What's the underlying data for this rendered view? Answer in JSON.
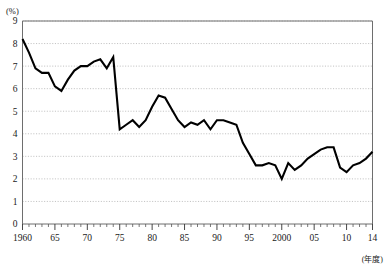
{
  "chart_data": {
    "type": "line",
    "title": "",
    "subtitle": "",
    "xlabel": "(年度)",
    "ylabel": "(%)",
    "ylim": [
      0,
      9
    ],
    "xlim": [
      1960,
      2014
    ],
    "grid": true,
    "legend": "none",
    "y_unit_label": "(%)",
    "x_unit_label": "(年度)",
    "y_ticks": [
      0,
      1,
      2,
      3,
      4,
      5,
      6,
      7,
      8,
      9
    ],
    "y_tick_labels": [
      "0",
      "1",
      "2",
      "3",
      "4",
      "5",
      "6",
      "7",
      "8",
      "9"
    ],
    "x_ticks": [
      1960,
      1965,
      1970,
      1975,
      1980,
      1985,
      1990,
      1995,
      2000,
      2005,
      2010,
      2014
    ],
    "x_tick_labels": [
      "1960",
      "65",
      "70",
      "75",
      "80",
      "85",
      "90",
      "95",
      "2000",
      "05",
      "10",
      "14"
    ],
    "x_minor_tick_step": 1,
    "series": [
      {
        "name": "",
        "color": "#000000",
        "x": [
          1960,
          1961,
          1962,
          1963,
          1964,
          1965,
          1966,
          1967,
          1968,
          1969,
          1970,
          1971,
          1972,
          1973,
          1974,
          1975,
          1976,
          1977,
          1978,
          1979,
          1980,
          1981,
          1982,
          1983,
          1984,
          1985,
          1986,
          1987,
          1988,
          1989,
          1990,
          1991,
          1992,
          1993,
          1994,
          1995,
          1996,
          1997,
          1998,
          1999,
          2000,
          2001,
          2002,
          2003,
          2004,
          2005,
          2006,
          2007,
          2008,
          2009,
          2010,
          2011,
          2012,
          2013,
          2014
        ],
        "values": [
          8.2,
          7.6,
          6.9,
          6.7,
          6.7,
          6.1,
          5.9,
          6.4,
          6.8,
          7.0,
          7.0,
          7.2,
          7.3,
          6.9,
          7.4,
          4.2,
          4.4,
          4.6,
          4.3,
          4.6,
          5.2,
          5.7,
          5.6,
          5.1,
          4.6,
          4.3,
          4.5,
          4.4,
          4.6,
          4.2,
          4.6,
          4.6,
          4.5,
          4.4,
          3.6,
          3.1,
          2.6,
          2.6,
          2.7,
          2.6,
          2.0,
          2.7,
          2.4,
          2.6,
          2.9,
          3.1,
          3.3,
          3.4,
          3.4,
          2.5,
          2.3,
          2.6,
          2.7,
          2.9,
          3.2
        ]
      }
    ]
  }
}
